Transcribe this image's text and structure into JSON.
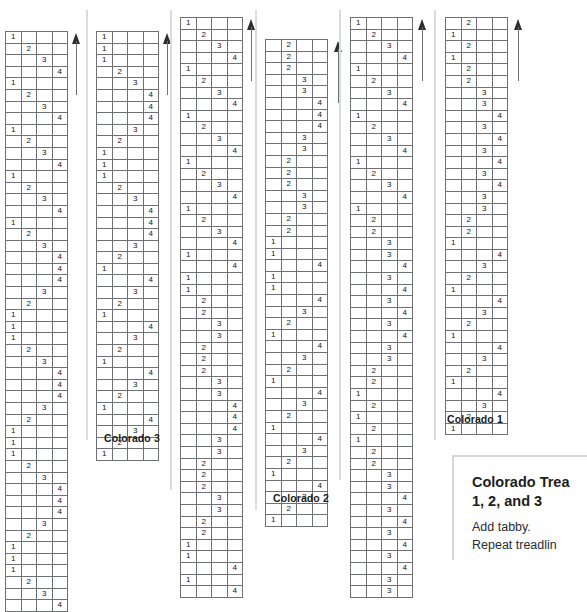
{
  "page": {
    "background": "#ffffff",
    "grid_line_color": "#6f7174",
    "text_color": "#1b1d20"
  },
  "drafts": [
    {
      "id": "draft-col-1",
      "name": "colorado-treadling-column-1",
      "label": "",
      "x": 5,
      "y": 31,
      "columns": 4,
      "has_arrow": true,
      "arrow_x": 71,
      "arrow_y": 33,
      "arrow_height": 62,
      "rows": [
        1,
        2,
        3,
        4,
        1,
        2,
        3,
        4,
        1,
        2,
        3,
        4,
        1,
        2,
        3,
        4,
        1,
        2,
        3,
        4,
        4,
        4,
        3,
        2,
        1,
        1,
        1,
        2,
        3,
        4,
        4,
        4,
        3,
        2,
        1,
        1,
        1,
        2,
        3,
        4,
        4,
        4,
        3,
        2,
        1,
        1,
        1,
        2,
        3,
        4
      ]
    },
    {
      "id": "draft-col-2",
      "name": "colorado-3-treadling",
      "label": "Colorado 3",
      "label_x": 104,
      "label_y": 432,
      "x": 96,
      "y": 31,
      "columns": 4,
      "has_arrow": true,
      "arrow_x": 162,
      "arrow_y": 33,
      "arrow_height": 62,
      "rows": [
        1,
        1,
        1,
        2,
        3,
        4,
        4,
        4,
        3,
        2,
        1,
        1,
        1,
        2,
        3,
        4,
        4,
        4,
        3,
        2,
        1,
        4,
        3,
        2,
        1,
        4,
        3,
        2,
        1,
        4,
        3,
        2,
        1,
        4,
        3,
        2,
        1
      ]
    },
    {
      "id": "draft-col-3",
      "name": "colorado-treadling-column-3",
      "label": "",
      "x": 180,
      "y": 17,
      "columns": 4,
      "has_arrow": true,
      "arrow_x": 246,
      "arrow_y": 19,
      "arrow_height": 62,
      "rows": [
        1,
        2,
        3,
        4,
        1,
        2,
        3,
        4,
        1,
        2,
        3,
        4,
        1,
        2,
        3,
        4,
        1,
        2,
        3,
        4,
        1,
        4,
        1,
        1,
        2,
        2,
        3,
        3,
        2,
        2,
        2,
        3,
        3,
        4,
        4,
        4,
        3,
        3,
        2,
        2,
        2,
        3,
        3,
        2,
        2,
        1,
        1,
        4,
        1,
        4
      ]
    },
    {
      "id": "draft-col-4",
      "name": "colorado-2-treadling",
      "label": "Colorado 2",
      "label_x": 273,
      "label_y": 492,
      "x": 265,
      "y": 39,
      "columns": 4,
      "has_arrow": true,
      "arrow_x": 333,
      "arrow_y": 41,
      "arrow_height": 62,
      "rows": [
        2,
        2,
        2,
        3,
        3,
        4,
        4,
        4,
        3,
        3,
        2,
        2,
        2,
        3,
        3,
        2,
        2,
        1,
        1,
        4,
        1,
        1,
        4,
        3,
        2,
        1,
        4,
        3,
        2,
        1,
        4,
        3,
        2,
        1,
        4,
        3,
        2,
        1,
        4,
        3,
        2,
        1
      ]
    },
    {
      "id": "draft-col-5",
      "name": "colorado-treadling-column-5",
      "label": "",
      "x": 350,
      "y": 17,
      "columns": 4,
      "has_arrow": true,
      "arrow_x": 417,
      "arrow_y": 19,
      "arrow_height": 62,
      "rows": [
        1,
        2,
        3,
        4,
        1,
        2,
        3,
        4,
        1,
        2,
        3,
        4,
        1,
        2,
        3,
        4,
        1,
        2,
        2,
        3,
        3,
        4,
        3,
        4,
        3,
        4,
        3,
        4,
        3,
        3,
        2,
        2,
        1,
        2,
        1,
        2,
        1,
        2,
        2,
        3,
        3,
        4,
        3,
        4,
        3,
        4,
        3,
        4,
        3,
        3
      ]
    },
    {
      "id": "draft-col-6",
      "name": "colorado-1-treadling",
      "label": "Colorado 1",
      "label_x": 447,
      "label_y": 413,
      "x": 445,
      "y": 17,
      "columns": 4,
      "has_arrow": true,
      "arrow_x": 513,
      "arrow_y": 19,
      "arrow_height": 62,
      "rows": [
        2,
        1,
        2,
        1,
        2,
        2,
        3,
        3,
        4,
        3,
        4,
        3,
        4,
        3,
        4,
        3,
        3,
        2,
        2,
        1,
        4,
        3,
        2,
        1,
        4,
        3,
        2,
        1,
        4,
        3,
        2,
        1,
        4,
        3,
        2,
        1
      ]
    }
  ],
  "note": {
    "name": "colorado-treadlings-note",
    "title_line_1": "Colorado Trea",
    "title_line_2": "1, 2, and 3",
    "body_line_1": "Add tabby.",
    "body_line_2": "Repeat treadlin"
  }
}
